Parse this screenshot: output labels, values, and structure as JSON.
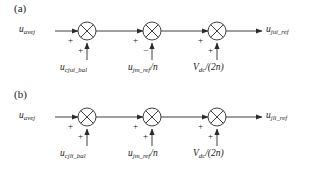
{
  "figure": {
    "type": "block-diagram",
    "panels": [
      {
        "id": "a",
        "label": "(a)",
        "input": {
          "base": "u",
          "sub": "avej"
        },
        "output": {
          "base": "u",
          "sub": "jui_ref"
        },
        "junctions": [
          {
            "index": 1,
            "left_sign": "+",
            "bottom_sign": "+",
            "bottom_label": {
              "base": "u",
              "sub": "cjui_bal",
              "suffix": ""
            }
          },
          {
            "index": 2,
            "left_sign": "+",
            "bottom_sign": "−",
            "bottom_label": {
              "base": "u",
              "sub": "jm_ref",
              "suffix": "/n"
            }
          },
          {
            "index": 3,
            "left_sign": "+",
            "bottom_sign": "+",
            "bottom_label": {
              "base": "V",
              "sub": "dc",
              "suffix": "/(2n)"
            }
          }
        ]
      },
      {
        "id": "b",
        "label": "(b)",
        "input": {
          "base": "u",
          "sub": "avej"
        },
        "output": {
          "base": "u",
          "sub": "jli_ref"
        },
        "junctions": [
          {
            "index": 1,
            "left_sign": "+",
            "bottom_sign": "+",
            "bottom_label": {
              "base": "u",
              "sub": "cjli_bal",
              "suffix": ""
            }
          },
          {
            "index": 2,
            "left_sign": "+",
            "bottom_sign": "+",
            "bottom_label": {
              "base": "u",
              "sub": "jm_ref",
              "suffix": "/n"
            }
          },
          {
            "index": 3,
            "left_sign": "+",
            "bottom_sign": "+",
            "bottom_label": {
              "base": "V",
              "sub": "dc",
              "suffix": "/(2n)"
            }
          }
        ]
      }
    ],
    "colors": {
      "line": "#2b2b2b",
      "text": "#1a1a1a",
      "background": "#ffffff"
    }
  }
}
